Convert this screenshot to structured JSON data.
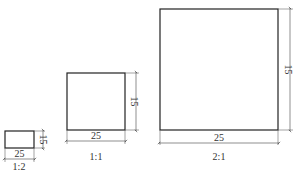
{
  "diagram": {
    "figures": [
      {
        "scale_label": "1:2",
        "width_label": "25",
        "height_label": "15",
        "box": {
          "x": 5,
          "y": 131,
          "w": 29,
          "h": 17
        }
      },
      {
        "scale_label": "1:1",
        "width_label": "25",
        "height_label": "15",
        "box": {
          "x": 67,
          "y": 73,
          "w": 58,
          "h": 57
        }
      },
      {
        "scale_label": "2:1",
        "width_label": "25",
        "height_label": "15",
        "box": {
          "x": 160,
          "y": 9,
          "w": 118,
          "h": 121
        }
      }
    ]
  },
  "colors": {
    "line": "#222222",
    "background": "#ffffff"
  }
}
